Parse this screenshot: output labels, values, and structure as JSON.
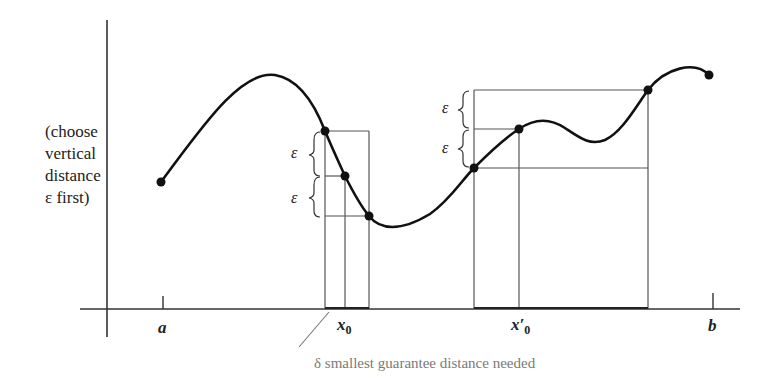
{
  "diagram": {
    "type": "uniform-continuity-illustration",
    "side_label": {
      "lines": [
        "(choose",
        "vertical",
        "distance",
        "ε first)"
      ]
    },
    "axis_labels": {
      "a": "a",
      "x0": "x",
      "x0_sub": "0",
      "x0_prime": "x′",
      "x0_prime_sub": "0",
      "b": "b"
    },
    "epsilon_symbol": "ε",
    "caption": "δ smallest guarantee distance needed",
    "colors": {
      "curve": "#111111",
      "grid_lines": "#555555",
      "caption": "#7a7a7a",
      "axes": "#333333"
    },
    "marked_points": [
      {
        "name": "start-a",
        "x": 161,
        "y": 182
      },
      {
        "name": "left-upper",
        "x": 325,
        "y": 131
      },
      {
        "name": "x0-point",
        "x": 345,
        "y": 176
      },
      {
        "name": "left-lower",
        "x": 369,
        "y": 216
      },
      {
        "name": "right-lower",
        "x": 474,
        "y": 168
      },
      {
        "name": "x0-prime-point",
        "x": 519,
        "y": 129
      },
      {
        "name": "right-upper",
        "x": 648,
        "y": 90
      },
      {
        "name": "end-b",
        "x": 709,
        "y": 75
      }
    ]
  }
}
